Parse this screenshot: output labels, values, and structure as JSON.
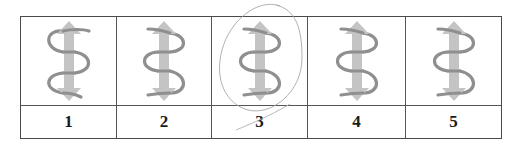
{
  "figure": {
    "options": [
      {
        "label": "1",
        "icon": "double-arrow-with-coil-icon",
        "coil_start": "left",
        "selected": false
      },
      {
        "label": "2",
        "icon": "double-arrow-with-coil-icon",
        "coil_start": "right",
        "selected": false
      },
      {
        "label": "3",
        "icon": "double-arrow-with-coil-icon",
        "coil_start": "right",
        "selected": true
      },
      {
        "label": "4",
        "icon": "double-arrow-with-coil-icon",
        "coil_start": "right",
        "selected": false
      },
      {
        "label": "5",
        "icon": "double-arrow-with-coil-icon",
        "coil_start": "right",
        "selected": false
      }
    ],
    "colors": {
      "arrow": "#c4c4c4",
      "coil": "#8f8f8f",
      "border": "#4a4a4a",
      "pencil_mark": "#9a9a9a"
    },
    "annotation": "pencil-circle-around-option-3"
  }
}
